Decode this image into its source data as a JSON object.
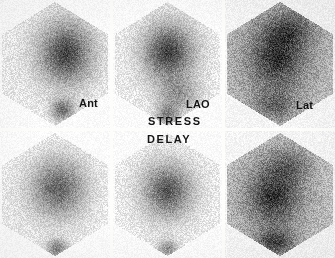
{
  "figure": {
    "kind": "nuclear-medicine-scintigraphy",
    "modality": "Thallium-201 myocardial perfusion scintigraphy",
    "width": 335,
    "height": 258,
    "background_color": "#f2f1ef",
    "gutter_color": "#fdfdfc",
    "ink_color": "#141414"
  },
  "labels": {
    "view_ant": "Ant",
    "view_lao": "LAO",
    "view_lat": "Lat",
    "phase_stress": "STRESS",
    "phase_delay": "DELAY"
  },
  "rows": [
    {
      "name": "stress",
      "label": "STRESS"
    },
    {
      "name": "delay",
      "label": "DELAY"
    }
  ],
  "columns": [
    {
      "name": "anterior",
      "label": "Ant"
    },
    {
      "name": "left-anterior-oblique",
      "label": "LAO"
    },
    {
      "name": "lateral",
      "label": "Lat"
    }
  ],
  "panels": [
    {
      "id": "stress-ant",
      "row": "stress",
      "column": "anterior",
      "x": 0,
      "y": 0,
      "w": 110,
      "h": 128,
      "field_shape": "hexagon",
      "field_tint": 0.055,
      "base_gray": 244,
      "grain": 26,
      "blobs": [
        {
          "cx": 0.6,
          "cy": 0.42,
          "rx": 0.235,
          "ry": 0.235,
          "strength": 0.92,
          "falloff": 1.8
        },
        {
          "cx": 0.57,
          "cy": 0.86,
          "rx": 0.105,
          "ry": 0.085,
          "strength": 0.62,
          "falloff": 2.1
        }
      ]
    },
    {
      "id": "stress-lao",
      "row": "stress",
      "column": "left-anterior-oblique",
      "x": 113,
      "y": 0,
      "w": 109,
      "h": 128,
      "field_shape": "hexagon",
      "field_tint": 0.055,
      "base_gray": 244,
      "grain": 26,
      "blobs": [
        {
          "cx": 0.51,
          "cy": 0.41,
          "rx": 0.225,
          "ry": 0.215,
          "strength": 0.94,
          "falloff": 1.8
        },
        {
          "cx": 0.6,
          "cy": 0.74,
          "rx": 0.19,
          "ry": 0.13,
          "strength": 0.38,
          "falloff": 2.2
        },
        {
          "cx": 0.5,
          "cy": 0.9,
          "rx": 0.105,
          "ry": 0.08,
          "strength": 0.55,
          "falloff": 2.1
        }
      ]
    },
    {
      "id": "stress-lat",
      "row": "stress",
      "column": "lateral",
      "x": 225,
      "y": 0,
      "w": 110,
      "h": 128,
      "field_shape": "hexagon",
      "field_tint": 0.33,
      "base_gray": 238,
      "grain": 34,
      "blobs": [
        {
          "cx": 0.47,
          "cy": 0.46,
          "rx": 0.27,
          "ry": 0.255,
          "strength": 0.78,
          "falloff": 1.7
        },
        {
          "cx": 0.6,
          "cy": 0.22,
          "rx": 0.23,
          "ry": 0.15,
          "strength": 0.42,
          "falloff": 2.0
        },
        {
          "cx": 0.45,
          "cy": 0.83,
          "rx": 0.2,
          "ry": 0.12,
          "strength": 0.4,
          "falloff": 2.0
        }
      ]
    },
    {
      "id": "delay-ant",
      "row": "delay",
      "column": "anterior",
      "x": 0,
      "y": 131,
      "w": 110,
      "h": 127,
      "field_shape": "hexagon",
      "field_tint": 0.045,
      "base_gray": 245,
      "grain": 25,
      "blobs": [
        {
          "cx": 0.53,
          "cy": 0.45,
          "rx": 0.25,
          "ry": 0.23,
          "strength": 0.74,
          "falloff": 1.9
        },
        {
          "cx": 0.52,
          "cy": 0.93,
          "rx": 0.095,
          "ry": 0.075,
          "strength": 0.58,
          "falloff": 2.1
        }
      ]
    },
    {
      "id": "delay-lao",
      "row": "delay",
      "column": "left-anterior-oblique",
      "x": 113,
      "y": 131,
      "w": 109,
      "h": 127,
      "field_shape": "hexagon",
      "field_tint": 0.05,
      "base_gray": 244,
      "grain": 26,
      "blobs": [
        {
          "cx": 0.5,
          "cy": 0.47,
          "rx": 0.22,
          "ry": 0.21,
          "strength": 0.82,
          "falloff": 1.8
        },
        {
          "cx": 0.5,
          "cy": 0.93,
          "rx": 0.09,
          "ry": 0.07,
          "strength": 0.5,
          "falloff": 2.1
        }
      ]
    },
    {
      "id": "delay-lat",
      "row": "delay",
      "column": "lateral",
      "x": 225,
      "y": 131,
      "w": 110,
      "h": 127,
      "field_shape": "hexagon",
      "field_tint": 0.3,
      "base_gray": 238,
      "grain": 34,
      "blobs": [
        {
          "cx": 0.44,
          "cy": 0.52,
          "rx": 0.255,
          "ry": 0.235,
          "strength": 0.8,
          "falloff": 1.7
        },
        {
          "cx": 0.58,
          "cy": 0.26,
          "rx": 0.22,
          "ry": 0.15,
          "strength": 0.36,
          "falloff": 2.0
        },
        {
          "cx": 0.46,
          "cy": 0.88,
          "rx": 0.175,
          "ry": 0.105,
          "strength": 0.62,
          "falloff": 1.9
        }
      ]
    }
  ],
  "gutters": {
    "vertical_x": [
      110,
      222
    ],
    "horizontal_y": [
      128
    ]
  }
}
